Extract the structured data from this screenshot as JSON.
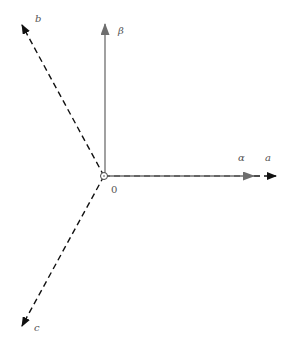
{
  "diagram": {
    "origin_label": "0",
    "axes": {
      "alpha": {
        "label": "α",
        "style": "solid",
        "color": "#6e6e6e"
      },
      "beta": {
        "label": "β",
        "style": "solid",
        "color": "#6e6e6e"
      },
      "a": {
        "label": "a",
        "style": "dashed",
        "color": "#111111"
      },
      "b": {
        "label": "b",
        "style": "dashed",
        "color": "#111111"
      },
      "c": {
        "label": "c",
        "style": "dashed",
        "color": "#111111"
      }
    }
  }
}
